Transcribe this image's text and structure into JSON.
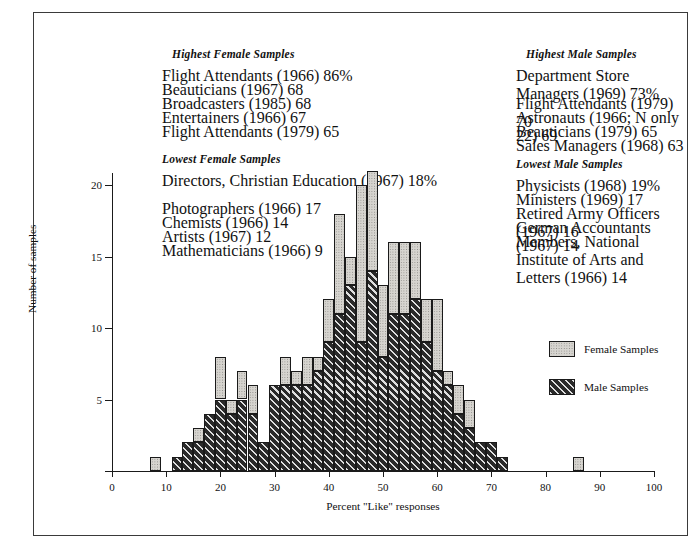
{
  "blocks": [
    {
      "id": "highest-female",
      "title": "Highest Female Samples",
      "rows": [
        {
          "label": "Flight Attendants (1966)",
          "value": "86%"
        },
        {
          "label": "Beauticians (1967)",
          "value": "68"
        },
        {
          "label": "Broadcasters (1985)",
          "value": "68"
        },
        {
          "label": "Entertainers (1966)",
          "value": "67"
        },
        {
          "label": "Flight Attendants (1979)",
          "value": "65"
        }
      ]
    },
    {
      "id": "lowest-female",
      "title": "Lowest Female Samples",
      "rows": [
        {
          "label": "Directors, Christian",
          "label2": "Education (1967)",
          "value": "18%"
        },
        {
          "label": "Photographers (1966)",
          "value": "17"
        },
        {
          "label": "Chemists (1966)",
          "value": "14"
        },
        {
          "label": "Artists (1967)",
          "value": "12"
        },
        {
          "label": "Mathematicians (1966)",
          "value": "9"
        }
      ]
    },
    {
      "id": "highest-male",
      "title": "Highest Male Samples",
      "rows": [
        {
          "label": "Department Store",
          "label2": "Managers (1969)",
          "value": "73%"
        },
        {
          "label": "Flight Attendants (1979)",
          "value": "70"
        },
        {
          "label": "Astronauts (1966; N only 22)",
          "value": "69"
        },
        {
          "label": "Beauticians (1979)",
          "value": "65"
        },
        {
          "label": "Sales Managers (1968)",
          "value": "63"
        }
      ]
    },
    {
      "id": "lowest-male",
      "title": "Lowest Male Samples",
      "rows": [
        {
          "label": "Physicists (1968)",
          "value": "19%"
        },
        {
          "label": "Ministers (1969)",
          "value": "17"
        },
        {
          "label": "Retired Army Officers (1967)",
          "value": "16"
        },
        {
          "label": "German Accountants (1967)",
          "value": "14"
        },
        {
          "label": "Members, National Institute",
          "label2": "of Arts and Letters (1966)",
          "value": "14"
        }
      ]
    }
  ],
  "legend": {
    "items": [
      {
        "label": "Female Samples",
        "pattern": "stipple",
        "color": "#d6d4cf"
      },
      {
        "label": "Male Samples",
        "pattern": "diagonal-hatch",
        "color": "#2a2a2a"
      }
    ]
  },
  "chart_data": {
    "type": "bar",
    "subtype": "stacked-histogram",
    "title": "",
    "xlabel": "Percent \"Like\" responses",
    "ylabel": "Number of samples",
    "xlim": [
      0,
      100
    ],
    "ylim": [
      0,
      22
    ],
    "xticks": [
      0,
      10,
      20,
      30,
      40,
      50,
      60,
      70,
      80,
      90,
      100
    ],
    "yticks": [
      0,
      5,
      10,
      15,
      20
    ],
    "grid": false,
    "legend_position": "right",
    "bin_width": 2,
    "categories": [
      8,
      12,
      14,
      16,
      18,
      20,
      22,
      24,
      26,
      28,
      30,
      32,
      34,
      36,
      38,
      40,
      42,
      44,
      46,
      48,
      50,
      52,
      54,
      56,
      58,
      60,
      62,
      64,
      66,
      68,
      70,
      72,
      86
    ],
    "series": [
      {
        "name": "Male Samples",
        "values": [
          0,
          1,
          2,
          2,
          4,
          5,
          4,
          5,
          4,
          2,
          6,
          6,
          6,
          6,
          7,
          9,
          11,
          13,
          9,
          14,
          8,
          11,
          11,
          12,
          9,
          7,
          6,
          4,
          3,
          2,
          2,
          1,
          0
        ]
      },
      {
        "name": "Female Samples",
        "values": [
          1,
          0,
          0,
          1,
          0,
          3,
          1,
          2,
          2,
          0,
          0,
          2,
          1,
          2,
          1,
          3,
          7,
          2,
          11,
          7,
          5,
          5,
          5,
          4,
          3,
          5,
          1,
          2,
          2,
          0,
          0,
          0,
          1
        ]
      }
    ],
    "totals": [
      1,
      1,
      2,
      3,
      4,
      8,
      5,
      7,
      6,
      2,
      6,
      8,
      7,
      8,
      8,
      12,
      18,
      15,
      20,
      21,
      13,
      16,
      16,
      16,
      12,
      12,
      7,
      6,
      5,
      2,
      2,
      1,
      1
    ]
  }
}
